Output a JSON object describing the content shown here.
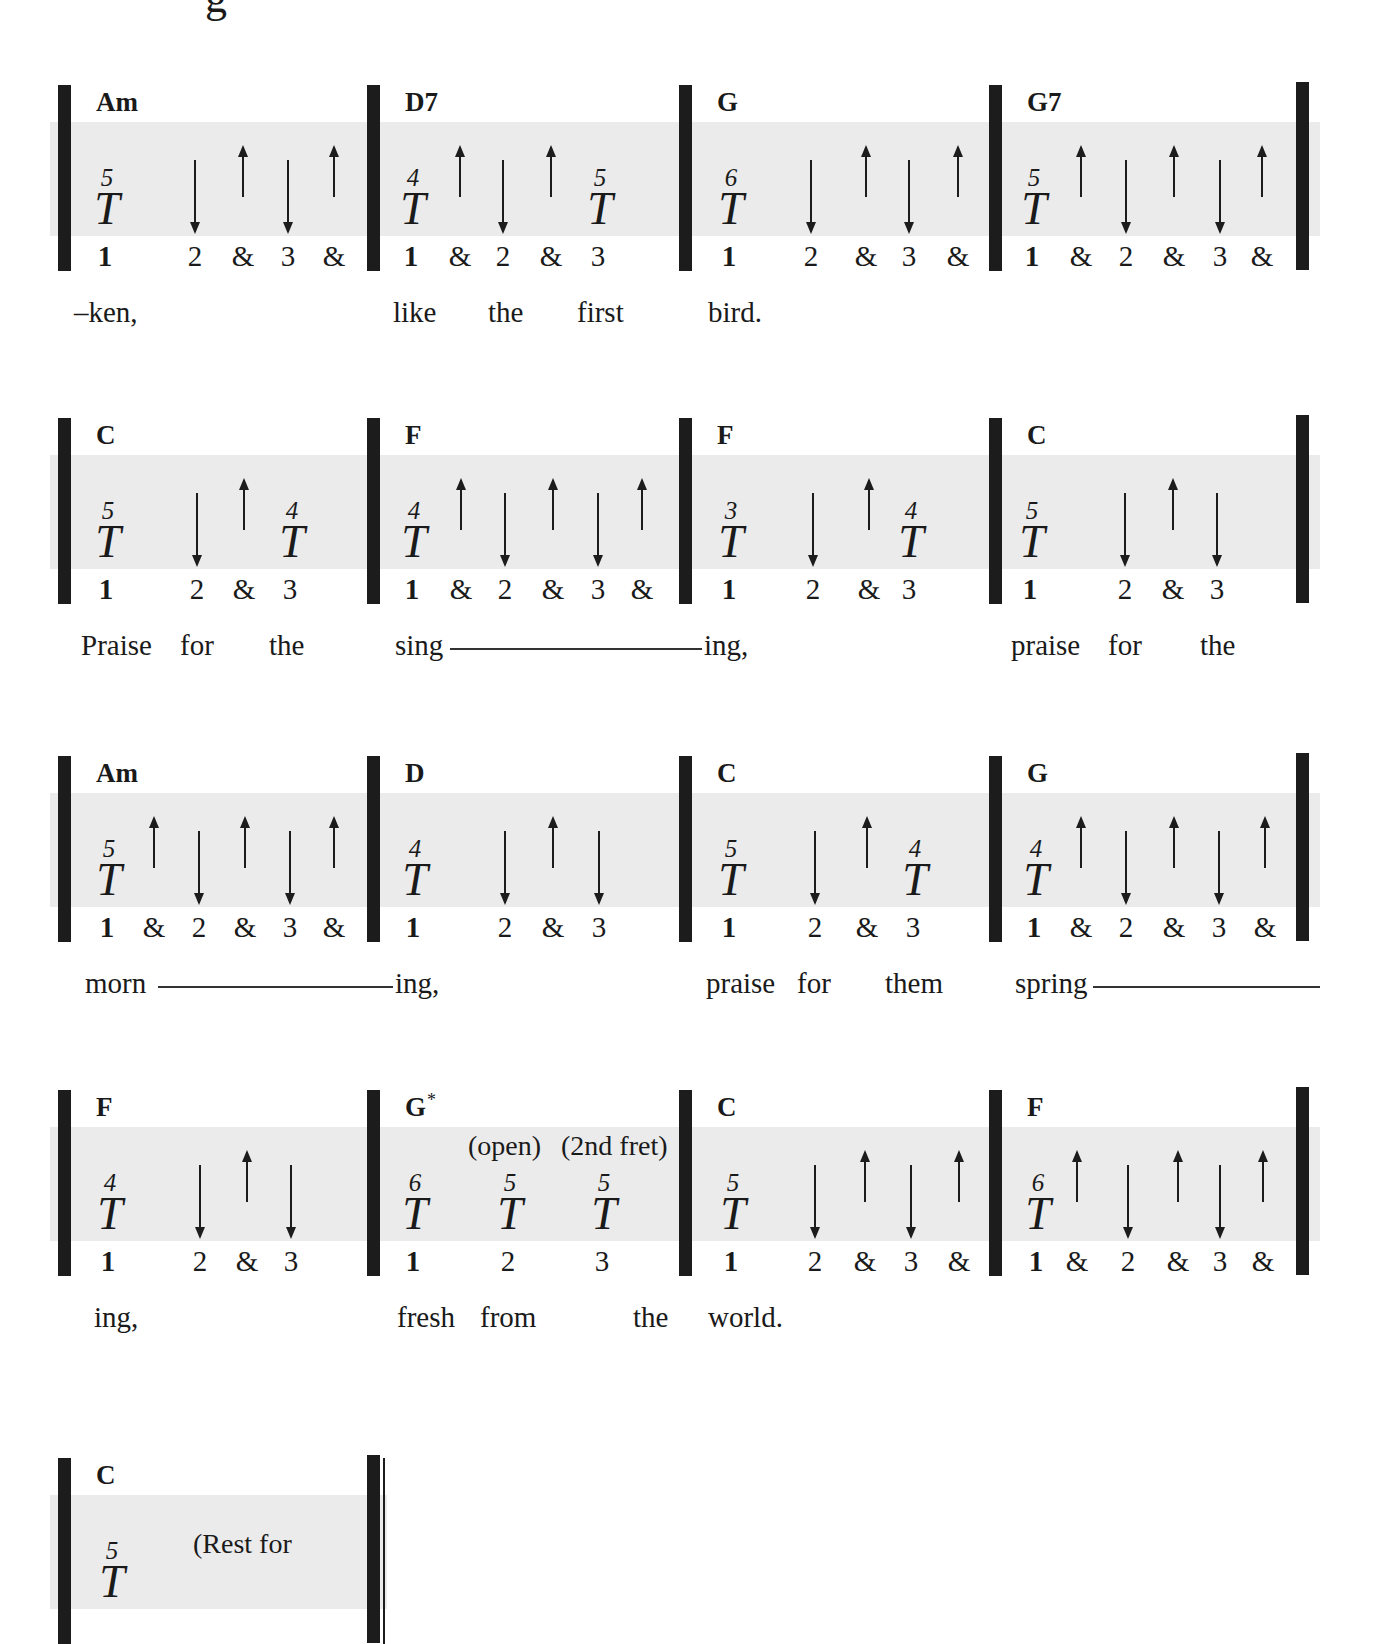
{
  "title_fragment": "g",
  "colors": {
    "band": "#ebebeb",
    "ink": "#1c1c1c"
  },
  "systems": [
    {
      "top": 85,
      "measures": [
        {
          "chord": "Am",
          "x0": 65,
          "thumbs": [
            {
              "beat": "1",
              "fret": "5"
            }
          ],
          "strums": [
            {
              "dir": "down",
              "beat": "2"
            },
            {
              "dir": "up",
              "beat": "&2"
            },
            {
              "dir": "down",
              "beat": "3"
            },
            {
              "dir": "up",
              "beat": "&3"
            }
          ],
          "counts": [
            "1",
            "2",
            "&",
            "3",
            "&"
          ],
          "count_pos": [
            105,
            195,
            243,
            288,
            334
          ]
        },
        {
          "chord": "D7",
          "x0": 374,
          "thumbs": [
            {
              "beat": "1",
              "fret": "4"
            },
            {
              "beat": "3",
              "fret": "5"
            }
          ],
          "strums": [
            {
              "dir": "up",
              "beat": "&1"
            },
            {
              "dir": "down",
              "beat": "2"
            },
            {
              "dir": "up",
              "beat": "&2"
            }
          ],
          "counts": [
            "1",
            "&",
            "2",
            "&",
            "3"
          ],
          "count_pos": [
            411,
            460,
            503,
            551,
            598
          ]
        },
        {
          "chord": "G",
          "x0": 686,
          "thumbs": [
            {
              "beat": "1",
              "fret": "6"
            }
          ],
          "strums": [
            {
              "dir": "down",
              "beat": "2"
            },
            {
              "dir": "up",
              "beat": "&2"
            },
            {
              "dir": "down",
              "beat": "3"
            },
            {
              "dir": "up",
              "beat": "&3"
            }
          ],
          "counts": [
            "1",
            "2",
            "&",
            "3",
            "&"
          ],
          "count_pos": [
            729,
            811,
            866,
            909,
            958
          ]
        },
        {
          "chord": "G7",
          "x0": 996,
          "x_end": 1303,
          "thumbs": [
            {
              "beat": "1",
              "fret": "5"
            }
          ],
          "strums": [
            {
              "dir": "up",
              "beat": "&1"
            },
            {
              "dir": "down",
              "beat": "2"
            },
            {
              "dir": "up",
              "beat": "&2"
            },
            {
              "dir": "down",
              "beat": "3"
            },
            {
              "dir": "up",
              "beat": "&3"
            }
          ],
          "counts": [
            "1",
            "&",
            "2",
            "&",
            "3",
            "&"
          ],
          "count_pos": [
            1032,
            1081,
            1126,
            1174,
            1220,
            1262
          ]
        }
      ],
      "lyrics": [
        {
          "text": "–ken,",
          "x": 74
        },
        {
          "text": "like",
          "x": 393
        },
        {
          "text": "the",
          "x": 488
        },
        {
          "text": "first",
          "x": 577
        },
        {
          "text": "bird.",
          "x": 708
        }
      ],
      "extenders": []
    },
    {
      "top": 418,
      "measures": [
        {
          "chord": "C",
          "x0": 65,
          "thumbs": [
            {
              "beat": "1",
              "fret": "5"
            },
            {
              "beat": "3",
              "fret": "4"
            }
          ],
          "strums": [
            {
              "dir": "down",
              "beat": "2"
            },
            {
              "dir": "up",
              "beat": "&2"
            }
          ],
          "counts": [
            "1",
            "2",
            "&",
            "3"
          ],
          "count_pos": [
            106,
            197,
            244,
            290
          ]
        },
        {
          "chord": "F",
          "x0": 374,
          "thumbs": [
            {
              "beat": "1",
              "fret": "4"
            }
          ],
          "strums": [
            {
              "dir": "up",
              "beat": "&1"
            },
            {
              "dir": "down",
              "beat": "2"
            },
            {
              "dir": "up",
              "beat": "&2"
            },
            {
              "dir": "down",
              "beat": "3"
            },
            {
              "dir": "up",
              "beat": "&3"
            }
          ],
          "counts": [
            "1",
            "&",
            "2",
            "&",
            "3",
            "&"
          ],
          "count_pos": [
            412,
            461,
            505,
            553,
            598,
            642
          ]
        },
        {
          "chord": "F",
          "x0": 686,
          "thumbs": [
            {
              "beat": "1",
              "fret": "3"
            },
            {
              "beat": "3",
              "fret": "4"
            }
          ],
          "strums": [
            {
              "dir": "down",
              "beat": "2"
            },
            {
              "dir": "up",
              "beat": "&2"
            },
            {
              "dir": "up",
              "beat": "&3"
            }
          ],
          "counts": [
            "1",
            "2",
            "&",
            "3"
          ],
          "count_pos": [
            729,
            813,
            869,
            909
          ]
        },
        {
          "chord": "C",
          "x0": 996,
          "x_end": 1303,
          "thumbs": [
            {
              "beat": "1",
              "fret": "5"
            }
          ],
          "strums": [
            {
              "dir": "down",
              "beat": "2"
            },
            {
              "dir": "up",
              "beat": "&2"
            },
            {
              "dir": "down",
              "beat": "3"
            }
          ],
          "counts": [
            "1",
            "2",
            "&",
            "3"
          ],
          "count_pos": [
            1030,
            1125,
            1173,
            1217
          ]
        }
      ],
      "lyrics": [
        {
          "text": "Praise",
          "x": 81
        },
        {
          "text": "for",
          "x": 180
        },
        {
          "text": "the",
          "x": 269
        },
        {
          "text": "sing",
          "x": 395
        },
        {
          "text": "ing,",
          "x": 704
        },
        {
          "text": "praise",
          "x": 1011
        },
        {
          "text": "for",
          "x": 1108
        },
        {
          "text": "the",
          "x": 1200
        }
      ],
      "extenders": [
        {
          "x": 450,
          "w": 252
        }
      ]
    },
    {
      "top": 756,
      "measures": [
        {
          "chord": "Am",
          "x0": 65,
          "thumbs": [
            {
              "beat": "1",
              "fret": "5"
            }
          ],
          "strums": [
            {
              "dir": "up",
              "beat": "&1"
            },
            {
              "dir": "down",
              "beat": "2"
            },
            {
              "dir": "up",
              "beat": "&2"
            },
            {
              "dir": "down",
              "beat": "3"
            },
            {
              "dir": "up",
              "beat": "&3"
            }
          ],
          "counts": [
            "1",
            "&",
            "2",
            "&",
            "3",
            "&"
          ],
          "count_pos": [
            107,
            154,
            199,
            245,
            290,
            334
          ]
        },
        {
          "chord": "D",
          "x0": 374,
          "thumbs": [
            {
              "beat": "1",
              "fret": "4"
            }
          ],
          "strums": [
            {
              "dir": "down",
              "beat": "2"
            },
            {
              "dir": "up",
              "beat": "&2"
            },
            {
              "dir": "down",
              "beat": "3"
            }
          ],
          "counts": [
            "1",
            "2",
            "&",
            "3"
          ],
          "count_pos": [
            413,
            505,
            553,
            599
          ]
        },
        {
          "chord": "C",
          "x0": 686,
          "thumbs": [
            {
              "beat": "1",
              "fret": "5"
            },
            {
              "beat": "3",
              "fret": "4"
            }
          ],
          "strums": [
            {
              "dir": "down",
              "beat": "2"
            },
            {
              "dir": "up",
              "beat": "&2"
            }
          ],
          "counts": [
            "1",
            "2",
            "&",
            "3"
          ],
          "count_pos": [
            729,
            815,
            867,
            913
          ]
        },
        {
          "chord": "G",
          "x0": 996,
          "x_end": 1303,
          "thumbs": [
            {
              "beat": "1",
              "fret": "4"
            }
          ],
          "strums": [
            {
              "dir": "up",
              "beat": "&1"
            },
            {
              "dir": "down",
              "beat": "2"
            },
            {
              "dir": "up",
              "beat": "&2"
            },
            {
              "dir": "down",
              "beat": "3"
            },
            {
              "dir": "up",
              "beat": "&3"
            }
          ],
          "counts": [
            "1",
            "&",
            "2",
            "&",
            "3",
            "&"
          ],
          "count_pos": [
            1034,
            1081,
            1126,
            1174,
            1219,
            1265
          ]
        }
      ],
      "lyrics": [
        {
          "text": "morn",
          "x": 85
        },
        {
          "text": "ing,",
          "x": 395
        },
        {
          "text": "praise",
          "x": 706
        },
        {
          "text": "for",
          "x": 797
        },
        {
          "text": "them",
          "x": 885
        },
        {
          "text": "spring",
          "x": 1015
        }
      ],
      "extenders": [
        {
          "x": 158,
          "w": 235
        },
        {
          "x": 1093,
          "w": 227
        }
      ]
    },
    {
      "top": 1090,
      "measures": [
        {
          "chord": "F",
          "x0": 65,
          "thumbs": [
            {
              "beat": "1",
              "fret": "4"
            }
          ],
          "strums": [
            {
              "dir": "down",
              "beat": "2"
            },
            {
              "dir": "up",
              "beat": "&2"
            },
            {
              "dir": "down",
              "beat": "3"
            }
          ],
          "counts": [
            "1",
            "2",
            "&",
            "3"
          ],
          "count_pos": [
            108,
            200,
            247,
            291
          ]
        },
        {
          "chord": "G",
          "chord_mark": "*",
          "x0": 374,
          "thumbs": [
            {
              "beat": "1",
              "fret": "6"
            },
            {
              "beat": "2",
              "fret": "5"
            },
            {
              "beat": "3",
              "fret": "5"
            }
          ],
          "strums": [],
          "counts": [
            "1",
            "2",
            "3"
          ],
          "count_pos": [
            413,
            508,
            602
          ],
          "notes": [
            {
              "text": "(open)",
              "x": 468
            },
            {
              "text": "(2nd fret)",
              "x": 561
            }
          ]
        },
        {
          "chord": "C",
          "x0": 686,
          "thumbs": [
            {
              "beat": "1",
              "fret": "5"
            }
          ],
          "strums": [
            {
              "dir": "down",
              "beat": "2"
            },
            {
              "dir": "up",
              "beat": "&2"
            },
            {
              "dir": "down",
              "beat": "3"
            },
            {
              "dir": "up",
              "beat": "&3"
            }
          ],
          "counts": [
            "1",
            "2",
            "&",
            "3",
            "&"
          ],
          "count_pos": [
            731,
            815,
            865,
            911,
            959
          ]
        },
        {
          "chord": "F",
          "x0": 996,
          "x_end": 1303,
          "thumbs": [
            {
              "beat": "1",
              "fret": "6"
            }
          ],
          "strums": [
            {
              "dir": "up",
              "beat": "&1"
            },
            {
              "dir": "down",
              "beat": "2"
            },
            {
              "dir": "up",
              "beat": "&2"
            },
            {
              "dir": "down",
              "beat": "3"
            },
            {
              "dir": "up",
              "beat": "&3"
            }
          ],
          "counts": [
            "1",
            "&",
            "2",
            "&",
            "3",
            "&"
          ],
          "count_pos": [
            1036,
            1077,
            1128,
            1178,
            1220,
            1263
          ]
        }
      ],
      "lyrics": [
        {
          "text": "ing,",
          "x": 94
        },
        {
          "text": "fresh",
          "x": 397
        },
        {
          "text": "from",
          "x": 480
        },
        {
          "text": "the",
          "x": 633
        },
        {
          "text": "world.",
          "x": 708
        }
      ],
      "extenders": []
    },
    {
      "top": 1458,
      "final": true,
      "measures": [
        {
          "chord": "C",
          "x0": 65,
          "x_end": 374,
          "thumbs": [
            {
              "beat": "1",
              "fret": "5"
            }
          ],
          "strums": [],
          "counts": [],
          "count_pos": [],
          "notes": [
            {
              "text": "(Rest for",
              "x": 193
            }
          ]
        }
      ],
      "lyrics": [],
      "extenders": []
    }
  ]
}
